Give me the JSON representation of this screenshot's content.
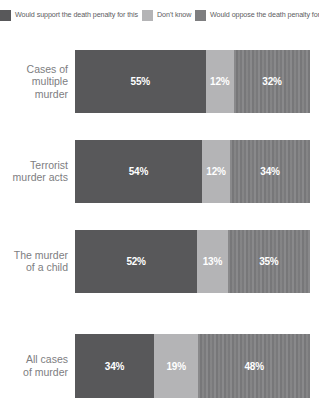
{
  "legend": {
    "items": [
      {
        "label": "Would support the death penalty for this",
        "color": "#58585a",
        "icon": "legend-swatch-support"
      },
      {
        "label": "Don't know",
        "color": "#b4b4b6",
        "icon": "legend-swatch-dontknow"
      },
      {
        "label": "Would oppose the death penalty for this",
        "color": "#7e7e80",
        "icon": "legend-swatch-oppose"
      }
    ]
  },
  "colors": {
    "support": "#58585a",
    "dont_know": "#b4b4b6",
    "oppose": "#7e7e80",
    "label_text": "#7d7d7f",
    "value_text": "#ffffff",
    "background": "#ffffff"
  },
  "rows": [
    {
      "label": "Cases of\nmultiple\nmurder",
      "segments": [
        {
          "value": "55%",
          "pct": 55
        },
        {
          "value": "12%",
          "pct": 12
        },
        {
          "value": "32%",
          "pct": 32
        }
      ]
    },
    {
      "label": "Terrorist\nmurder acts",
      "segments": [
        {
          "value": "54%",
          "pct": 54
        },
        {
          "value": "12%",
          "pct": 12
        },
        {
          "value": "34%",
          "pct": 34
        }
      ]
    },
    {
      "label": "The murder\nof a child",
      "segments": [
        {
          "value": "52%",
          "pct": 52
        },
        {
          "value": "13%",
          "pct": 13
        },
        {
          "value": "35%",
          "pct": 35
        }
      ]
    },
    {
      "label": "All cases\nof murder",
      "segments": [
        {
          "value": "34%",
          "pct": 34
        },
        {
          "value": "19%",
          "pct": 19
        },
        {
          "value": "48%",
          "pct": 48
        }
      ]
    }
  ],
  "chart_data": {
    "type": "bar",
    "orientation": "horizontal",
    "stacked": true,
    "title": "",
    "subtitle": "",
    "xlabel": "",
    "ylabel": "",
    "xlim": [
      0,
      100
    ],
    "grid": false,
    "legend_position": "top",
    "categories": [
      "Cases of multiple murder",
      "Terrorist murder acts",
      "The murder of a child",
      "All cases of murder"
    ],
    "series": [
      {
        "name": "Would support the death penalty for this",
        "color": "#58585a",
        "values": [
          55,
          54,
          52,
          34
        ]
      },
      {
        "name": "Don't know",
        "color": "#b4b4b6",
        "values": [
          12,
          12,
          13,
          19
        ]
      },
      {
        "name": "Would oppose the death penalty for this",
        "color": "#7e7e80",
        "values": [
          32,
          34,
          35,
          48
        ]
      }
    ],
    "value_labels": [
      [
        "55%",
        "12%",
        "32%"
      ],
      [
        "54%",
        "12%",
        "34%"
      ],
      [
        "52%",
        "13%",
        "35%"
      ],
      [
        "34%",
        "19%",
        "48%"
      ]
    ],
    "units": "percent"
  }
}
